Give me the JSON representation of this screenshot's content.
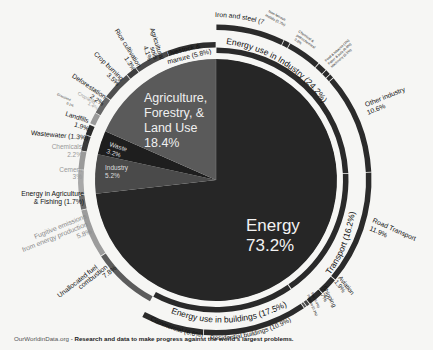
{
  "chart_data": {
    "type": "pie",
    "center_segments": [
      {
        "name": "Energy",
        "value": 73.2,
        "label": "Energy",
        "pct": "73.2%",
        "color": "#262626"
      },
      {
        "name": "Industry",
        "value": 5.2,
        "label": "Industry",
        "pct": "5.2%",
        "color": "#4a4a4a"
      },
      {
        "name": "Waste",
        "value": 3.2,
        "label": "Waste",
        "pct": "3.2%",
        "color": "#1e1e1e"
      },
      {
        "name": "Agriculture, Forestry, & Land Use",
        "value": 18.4,
        "label": "Agriculture, Forestry, & Land Use",
        "pct": "18.4%",
        "color": "#5a5a5a"
      }
    ],
    "energy_categories": [
      {
        "name": "Energy use in Industry",
        "value": 24.2,
        "label": "Energy use in Industry (24.2%)"
      },
      {
        "name": "Transport",
        "value": 16.2,
        "label": "Transport (16.2%)"
      },
      {
        "name": "Energy use in buildings",
        "value": 17.5,
        "label": "Energy use in buildings (17.5%)"
      },
      {
        "name": "Unallocated fuel combustion",
        "value": 7.8
      },
      {
        "name": "Fugitive emissions from energy production",
        "value": 5.8
      },
      {
        "name": "Energy in Agriculture & Fishing",
        "value": 1.7
      }
    ],
    "subsectors": [
      {
        "name": "Iron and steel",
        "value": 7.2,
        "group": "Energy use in Industry"
      },
      {
        "name": "Non-ferrous metals",
        "value": 0.7,
        "group": "Energy use in Industry"
      },
      {
        "name": "Chemical & petrochemical",
        "value": 3.6,
        "group": "Energy use in Industry"
      },
      {
        "name": "Food & tobacco",
        "value": 1.0,
        "group": "Energy use in Industry"
      },
      {
        "name": "Paper & pulp",
        "value": 0.6,
        "group": "Energy use in Industry"
      },
      {
        "name": "Machinery",
        "value": 0.5,
        "group": "Energy use in Industry"
      },
      {
        "name": "Other industry",
        "value": 10.6,
        "group": "Energy use in Industry"
      },
      {
        "name": "Road Transport",
        "value": 11.9,
        "group": "Transport"
      },
      {
        "name": "Aviation",
        "value": 1.9,
        "group": "Transport"
      },
      {
        "name": "Shipping",
        "value": 1.7,
        "group": "Transport"
      },
      {
        "name": "Rail",
        "value": 0.4,
        "group": "Transport"
      },
      {
        "name": "Pipeline",
        "value": 0.3,
        "group": "Transport"
      },
      {
        "name": "Residential buildings",
        "value": 10.9,
        "group": "Energy use in buildings"
      },
      {
        "name": "Commercial",
        "value": 6.6,
        "group": "Energy use in buildings"
      },
      {
        "name": "Unallocated fuel combustion",
        "value": 7.8,
        "group": "Energy"
      },
      {
        "name": "Fugitive emissions from energy production",
        "value": 5.8,
        "group": "Energy"
      },
      {
        "name": "Energy in Agriculture & Fishing",
        "value": 1.7,
        "group": "Energy"
      },
      {
        "name": "Cement",
        "value": 3.0,
        "group": "Industry"
      },
      {
        "name": "Chemicals",
        "value": 2.2,
        "group": "Industry"
      },
      {
        "name": "Wastewater",
        "value": 1.3,
        "group": "Waste"
      },
      {
        "name": "Landfills",
        "value": 1.9,
        "group": "Waste"
      },
      {
        "name": "Grassland",
        "value": 0.1,
        "group": "Agriculture, Forestry, & Land Use"
      },
      {
        "name": "Cropland",
        "value": 1.4,
        "group": "Agriculture, Forestry, & Land Use"
      },
      {
        "name": "Deforestation",
        "value": 2.2,
        "group": "Agriculture, Forestry, & Land Use"
      },
      {
        "name": "Crop burning",
        "value": 3.5,
        "group": "Agriculture, Forestry, & Land Use"
      },
      {
        "name": "Rice cultivation",
        "value": 1.3,
        "group": "Agriculture, Forestry, & Land Use"
      },
      {
        "name": "Agricultural soils",
        "value": 4.1,
        "group": "Agriculture, Forestry, & Land Use"
      },
      {
        "name": "Livestock & manure",
        "value": 5.8,
        "group": "Agriculture, Forestry, & Land Use"
      }
    ],
    "xlabel": "",
    "ylabel": "",
    "legend": "none (direct labels)"
  },
  "labels": {
    "energy_title": "Energy",
    "energy_pct": "73.2%",
    "afolu_l1": "Agriculture,",
    "afolu_l2": "Forestry, &",
    "afolu_l3": "Land Use",
    "afolu_pct": "18.4%",
    "waste_l1": "Waste",
    "waste_pct": "3.2%",
    "industry_l1": "Industry",
    "industry_pct": "5.2%",
    "iron_steel": "Iron and steel (7.2%)",
    "nonferrous_l1": "Non-ferrous",
    "nonferrous_l2": "metals (0.7%)",
    "chem_l1": "Chemical &",
    "chem_l2": "petrochemical",
    "chem_l3": "3.6%",
    "food": "Food & tobacco (1%)",
    "paper": "Paper & pulp (0.6%)",
    "machinery": "Machinery (0.5%)",
    "other_ind_l1": "Other industry",
    "other_ind_l2": "10.6%",
    "road_l1": "Road Transport",
    "road_l2": "11.9%",
    "aviation_l1": "Aviation",
    "aviation_l2": "1.9%",
    "shipping_l1": "Shipping",
    "shipping_l2": "1.7%",
    "rail": "Rail (0.4%)",
    "pipeline": "Pipeline (0.3%)",
    "residential": "Residential buildings (10.9%)",
    "commercial": "Commercial (6.6%)",
    "unalloc_l1": "Unallocated fuel",
    "unalloc_l2": "combustion",
    "unalloc_l3": "7.8%",
    "fugitive_l1": "Fugitive emissions",
    "fugitive_l2": "from energy production",
    "fugitive_l3": "5.8%",
    "agfish_l1": "Energy in Agriculture",
    "agfish_l2": "& Fishing (1.7%)",
    "cement_l1": "Cement",
    "cement_l2": "3%",
    "chemicals_l1": "Chemicals",
    "chemicals_l2": "2.2%",
    "wastewater": "Wastewater (1.3%)",
    "landfills_l1": "Landfills",
    "landfills_l2": "1.9%",
    "grassland_l1": "Grassland",
    "grassland_l2": "0.1%",
    "cropland_l1": "Cropland",
    "cropland_l2": "1.4%",
    "deforest_l1": "Deforestation",
    "deforest_l2": "2.2%",
    "cropburn_l1": "Crop burning",
    "cropburn_l2": "3.5%",
    "rice_l1": "Rice cultivation",
    "rice_l2": "1.3%",
    "agsoils_l1": "Agricultural",
    "agsoils_l2": "soils",
    "agsoils_l3": "4.1%",
    "livestock_l1": "Livestock &",
    "livestock_l2": "manure (5.8%)",
    "cat_industry": "Energy use in Industry (24.2%)",
    "cat_transport": "Transport (16.2%)",
    "cat_buildings": "Energy use in buildings (17.5%)"
  },
  "footer": {
    "site": "OurWorldinData.org",
    "sep": " - ",
    "tagline": "Research and data to make progress against the world's largest problems."
  },
  "colors": {
    "background": "#f6f6f4",
    "energy": "#262626",
    "ring_dark": "#2a2a2a",
    "afolu": "#5a5a5a",
    "industry": "#4a4a4a",
    "waste": "#1e1e1e",
    "light_gray": "#9a9a9a"
  }
}
